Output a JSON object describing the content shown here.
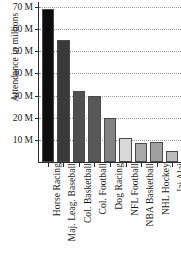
{
  "chart_data": {
    "type": "bar",
    "title": "",
    "xlabel": "",
    "ylabel": "Attendance in millions",
    "categories": [
      "Horse Racing",
      "Maj. Leag. Baseball",
      "Col. Basketball",
      "Col. Football",
      "Dog Racing",
      "NFL Football",
      "NBA Basketball",
      "NHL Hockey",
      "Jai Alai"
    ],
    "values": [
      69,
      55,
      32,
      30,
      20,
      11,
      8.5,
      9,
      5
    ],
    "bar_colors": [
      "#0d0d0d",
      "#3a3a3a",
      "#4f4f4f",
      "#585858",
      "#828282",
      "#d8d8d8",
      "#a8a8a8",
      "#a0a0a0",
      "#bcbcbc"
    ],
    "ylim": [
      0,
      70
    ],
    "ytick_values": [
      10,
      20,
      30,
      40,
      50,
      60,
      70
    ],
    "ytick_labels": [
      "10 M",
      "20 M",
      "30 M",
      "40 M",
      "50 M",
      "60 M",
      "70 M"
    ],
    "grid": true,
    "grid_style": "dotted",
    "legend": false,
    "axis_color": "#2b2b2b",
    "grid_color": "#9a9a9a",
    "background": "#ffffff"
  }
}
